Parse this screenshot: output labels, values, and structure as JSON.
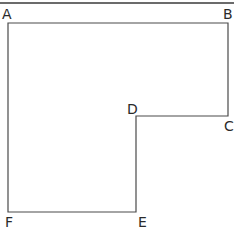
{
  "diagram": {
    "type": "L-shaped polygon",
    "stroke_color": "#4a4a4a",
    "top_rule_color": "#3a3a3a",
    "label_color": "#2a2a2a",
    "top_rule": {
      "x1": 0,
      "y1": 3,
      "x2": 234,
      "y2": 3
    },
    "vertices": [
      {
        "label": "A",
        "x": 8,
        "y": 23,
        "label_x": 2,
        "label_y": 19
      },
      {
        "label": "B",
        "x": 228,
        "y": 23,
        "label_x": 223,
        "label_y": 19
      },
      {
        "label": "C",
        "x": 228,
        "y": 116,
        "label_x": 224,
        "label_y": 131
      },
      {
        "label": "D",
        "x": 136,
        "y": 116,
        "label_x": 127,
        "label_y": 114
      },
      {
        "label": "E",
        "x": 136,
        "y": 212,
        "label_x": 138,
        "label_y": 227
      },
      {
        "label": "F",
        "x": 8,
        "y": 212,
        "label_x": 5,
        "label_y": 227
      }
    ],
    "labels": {
      "a": "A",
      "b": "B",
      "c": "C",
      "d": "D",
      "e": "E",
      "f": "F"
    }
  }
}
